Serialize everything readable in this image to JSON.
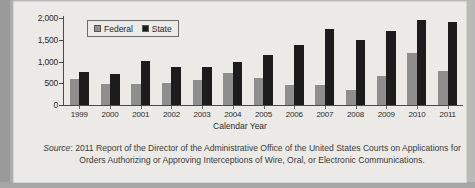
{
  "chart_data": {
    "type": "bar",
    "title": "",
    "xlabel": "Calendar Year",
    "ylabel": "",
    "ylim": [
      0,
      2000
    ],
    "yticks": [
      0,
      500,
      1000,
      1500,
      2000
    ],
    "ytick_labels": [
      "0",
      "500",
      "1,000",
      "1,500",
      "2,000"
    ],
    "grid": false,
    "legend_position": "top-left",
    "categories": [
      "1999",
      "2000",
      "2001",
      "2002",
      "2003",
      "2004",
      "2005",
      "2006",
      "2007",
      "2008",
      "2009",
      "2010",
      "2011"
    ],
    "series": [
      {
        "name": "Federal",
        "color": "#8e8e8e",
        "values": [
          601,
          479,
          486,
          497,
          578,
          730,
          625,
          461,
          457,
          350,
          663,
          1186,
          792
        ]
      },
      {
        "name": "State",
        "color": "#1c1c1c",
        "values": [
          749,
          711,
          1005,
          872,
          864,
          980,
          1148,
          1383,
          1751,
          1495,
          1700,
          1957,
          1900
        ]
      }
    ]
  },
  "legend": {
    "entries": [
      {
        "label": "Federal",
        "swatch": "federal"
      },
      {
        "label": "State",
        "swatch": "state"
      }
    ]
  },
  "axes": {
    "x_title": "Calendar Year"
  },
  "caption": {
    "source_word": "Source",
    "line1": ": 2011 Report of the Director of the Administrative Office of the United States Courts on Applications for",
    "line2": "Orders Authorizing or Approving Interceptions of Wire, Oral, or Electronic Communications."
  }
}
